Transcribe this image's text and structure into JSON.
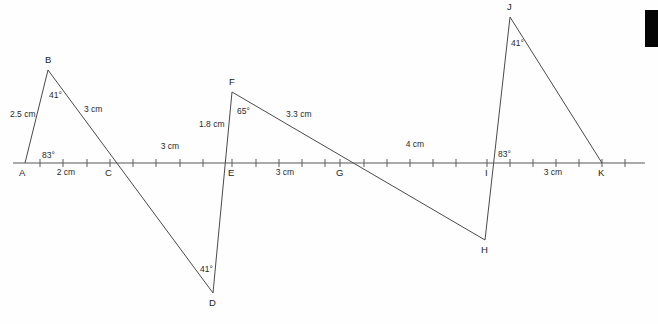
{
  "figure": {
    "background_color": "#fefefe",
    "line_color": "#4a4a4a",
    "text_color": "#1d1d1d",
    "width": 658,
    "height": 324
  },
  "points": [
    {
      "label": "A",
      "x": 25,
      "y": 163,
      "tx": 19,
      "ty": 176
    },
    {
      "label": "B",
      "x": 48,
      "y": 70,
      "tx": 45,
      "ty": 63
    },
    {
      "label": "C",
      "x": 110,
      "y": 163,
      "tx": 105,
      "ty": 176
    },
    {
      "label": "D",
      "x": 213,
      "y": 293,
      "tx": 209,
      "ty": 306
    },
    {
      "label": "E",
      "x": 232,
      "y": 163,
      "tx": 228,
      "ty": 176
    },
    {
      "label": "F",
      "x": 232,
      "y": 92,
      "tx": 229,
      "ty": 85
    },
    {
      "label": "G",
      "x": 340,
      "y": 163,
      "tx": 336,
      "ty": 176
    },
    {
      "label": "H",
      "x": 485,
      "y": 240,
      "tx": 481,
      "ty": 253
    },
    {
      "label": "I",
      "x": 487,
      "y": 163,
      "tx": 485,
      "ty": 176
    },
    {
      "label": "J",
      "x": 510,
      "y": 17,
      "tx": 507,
      "ty": 10
    },
    {
      "label": "K",
      "x": 602,
      "y": 163,
      "tx": 598,
      "ty": 176
    }
  ],
  "baseline": {
    "x_start": 13,
    "x_end": 645,
    "y": 163,
    "tick_half_height": 4,
    "tick_positions": [
      40,
      63,
      87,
      110,
      133,
      156,
      180,
      203,
      232,
      256,
      279,
      302,
      325,
      340,
      364,
      387,
      410,
      433,
      456,
      487,
      510,
      533,
      556,
      579,
      602,
      625
    ]
  },
  "segments": [
    {
      "name": "A-B",
      "from": "A",
      "to": "B"
    },
    {
      "name": "B-D",
      "from": "B",
      "to": "D"
    },
    {
      "name": "D-F",
      "from": "D",
      "to": "F"
    },
    {
      "name": "F-H",
      "from": "F",
      "to": "H"
    },
    {
      "name": "H-J",
      "from": "H",
      "to": "J"
    },
    {
      "name": "J-K",
      "from": "J",
      "to": "K"
    }
  ],
  "length_labels": [
    {
      "text": "2.5 cm",
      "x": 10,
      "y": 117,
      "anchor": "start"
    },
    {
      "text": "3 cm",
      "x": 84,
      "y": 112,
      "anchor": "start"
    },
    {
      "text": "2 cm",
      "x": 66,
      "y": 175,
      "anchor": "middle"
    },
    {
      "text": "3 cm",
      "x": 170,
      "y": 149,
      "anchor": "middle"
    },
    {
      "text": "1.8 cm",
      "x": 199,
      "y": 127,
      "anchor": "start"
    },
    {
      "text": "3.3 cm",
      "x": 286,
      "y": 117,
      "anchor": "start"
    },
    {
      "text": "3 cm",
      "x": 285,
      "y": 175,
      "anchor": "middle"
    },
    {
      "text": "4 cm",
      "x": 415,
      "y": 147,
      "anchor": "middle"
    },
    {
      "text": "3 cm",
      "x": 553,
      "y": 175,
      "anchor": "middle"
    }
  ],
  "angle_labels": [
    {
      "text": "83°",
      "x": 42,
      "y": 158,
      "at": "A"
    },
    {
      "text": "41°",
      "x": 49,
      "y": 98,
      "at": "B"
    },
    {
      "text": "41°",
      "x": 200,
      "y": 272,
      "at": "D"
    },
    {
      "text": "65°",
      "x": 237,
      "y": 114,
      "at": "F"
    },
    {
      "text": "83°",
      "x": 498,
      "y": 157,
      "at": "I"
    },
    {
      "text": "41°",
      "x": 511,
      "y": 46,
      "at": "J"
    }
  ],
  "artifact": {
    "name": "black-edge-bar",
    "x": 645,
    "y": 10,
    "width": 13,
    "height": 37,
    "color": "#050505"
  }
}
